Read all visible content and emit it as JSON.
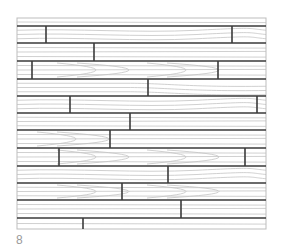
{
  "figure": {
    "label": "8",
    "frame": {
      "x": 17,
      "y": 18,
      "width": 249,
      "height": 211
    },
    "colors": {
      "board_edge": "#3a3a3a",
      "grain": "#c4c4c4",
      "frame": "#bdbdbd",
      "background": "#ffffff"
    },
    "rows": [
      {
        "top": 18,
        "bottom": 26,
        "seams": [],
        "grain": "straight"
      },
      {
        "top": 26,
        "bottom": 43,
        "seams": [
          46,
          232
        ],
        "grain": "wavy"
      },
      {
        "top": 43,
        "bottom": 61,
        "seams": [
          94
        ],
        "grain": "straight"
      },
      {
        "top": 61,
        "bottom": 79,
        "seams": [
          32,
          218
        ],
        "grain": "cathedral"
      },
      {
        "top": 79,
        "bottom": 96,
        "seams": [
          148
        ],
        "grain": "sweep"
      },
      {
        "top": 96,
        "bottom": 113,
        "seams": [
          70,
          257
        ],
        "grain": "wavy"
      },
      {
        "top": 113,
        "bottom": 130,
        "seams": [
          130
        ],
        "grain": "straight"
      },
      {
        "top": 130,
        "bottom": 148,
        "seams": [
          110
        ],
        "grain": "arc-left"
      },
      {
        "top": 148,
        "bottom": 166,
        "seams": [
          59,
          245
        ],
        "grain": "cathedral"
      },
      {
        "top": 166,
        "bottom": 183,
        "seams": [
          168
        ],
        "grain": "wavy"
      },
      {
        "top": 183,
        "bottom": 200,
        "seams": [
          122
        ],
        "grain": "cathedral"
      },
      {
        "top": 200,
        "bottom": 218,
        "seams": [
          181
        ],
        "grain": "straight"
      },
      {
        "top": 218,
        "bottom": 229,
        "seams": [
          83
        ],
        "grain": "straight"
      }
    ]
  }
}
